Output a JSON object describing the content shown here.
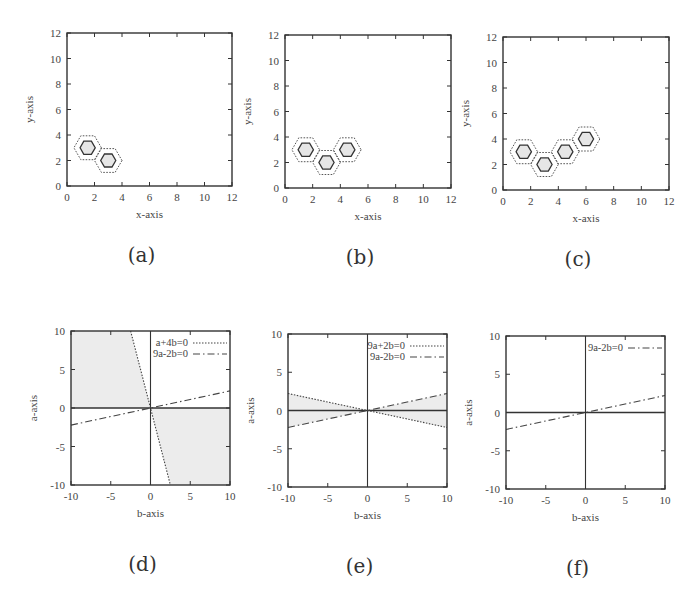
{
  "figure": {
    "captions": [
      "(a)",
      "(b)",
      "(c)",
      "(d)",
      "(e)",
      "(f)"
    ]
  },
  "colors": {
    "frame": "#333333",
    "hex_fill": "#e6e6e6",
    "shade": "#ececec",
    "line": "#444444"
  },
  "chart_data": [
    {
      "id": "a",
      "type": "diagram-scatter",
      "caption": "(a)",
      "xlabel": "x-axis",
      "ylabel": "y-axis",
      "xlim": [
        0,
        12
      ],
      "ylim": [
        0,
        12
      ],
      "xticks": [
        0,
        2,
        4,
        6,
        8,
        10,
        12
      ],
      "yticks": [
        0,
        2,
        4,
        6,
        8,
        10,
        12
      ],
      "grid": false,
      "frame": {
        "left": 67,
        "top": 33,
        "right": 232,
        "bottom": 186
      },
      "hexagons": [
        {
          "x": 1.5,
          "y": 3
        },
        {
          "x": 3,
          "y": 2
        }
      ],
      "hexagon_style": "solid inner hexagon (filled light gray) surrounded by dotted outer hexagon"
    },
    {
      "id": "b",
      "type": "diagram-scatter",
      "caption": "(b)",
      "xlabel": "x-axis",
      "ylabel": "y-axis",
      "xlim": [
        0,
        12
      ],
      "ylim": [
        0,
        12
      ],
      "xticks": [
        0,
        2,
        4,
        6,
        8,
        10,
        12
      ],
      "yticks": [
        0,
        2,
        4,
        6,
        8,
        10,
        12
      ],
      "grid": false,
      "frame": {
        "left": 285,
        "top": 35,
        "right": 451,
        "bottom": 188
      },
      "hexagons": [
        {
          "x": 1.5,
          "y": 3
        },
        {
          "x": 3,
          "y": 2
        },
        {
          "x": 4.5,
          "y": 3
        }
      ],
      "hexagon_style": "solid inner hexagon (filled light gray) surrounded by dotted outer hexagon"
    },
    {
      "id": "c",
      "type": "diagram-scatter",
      "caption": "(c)",
      "xlabel": "x-axis",
      "ylabel": "y-axis",
      "xlim": [
        0,
        12
      ],
      "ylim": [
        0,
        12
      ],
      "xticks": [
        0,
        2,
        4,
        6,
        8,
        10,
        12
      ],
      "yticks": [
        0,
        2,
        4,
        6,
        8,
        10,
        12
      ],
      "grid": false,
      "frame": {
        "left": 503,
        "top": 37,
        "right": 669,
        "bottom": 190
      },
      "hexagons": [
        {
          "x": 1.5,
          "y": 3
        },
        {
          "x": 3,
          "y": 2
        },
        {
          "x": 4.5,
          "y": 3
        },
        {
          "x": 6,
          "y": 4
        }
      ],
      "hexagon_style": "solid inner hexagon (filled light gray) surrounded by dotted outer hexagon"
    },
    {
      "id": "d",
      "type": "line",
      "caption": "(d)",
      "xlabel": "b-axis",
      "ylabel": "a-axis",
      "xlim": [
        -10,
        10
      ],
      "ylim": [
        -10,
        10
      ],
      "xticks": [
        -10,
        -5,
        0,
        5,
        10
      ],
      "yticks": [
        -10,
        -5,
        0,
        5,
        10
      ],
      "grid": false,
      "legend_position": "top-right",
      "frame": {
        "left": 71,
        "top": 331,
        "right": 230,
        "bottom": 485
      },
      "series": [
        {
          "name": "a+4b=0",
          "equation": "a = -4b",
          "style": "dotted",
          "points": [
            [
              -2.5,
              10
            ],
            [
              2.5,
              -10
            ]
          ]
        },
        {
          "name": "9a-2b=0",
          "equation": "a = 2b/9",
          "style": "dash-dot",
          "points": [
            [
              -10,
              -2.22
            ],
            [
              10,
              2.22
            ]
          ]
        }
      ],
      "axes_lines": [
        "a=0",
        "b=0"
      ],
      "shaded_regions": [
        {
          "description": "between a-axis top-left and line a+4b=0 above a=0",
          "polygon": [
            [
              -10,
              0
            ],
            [
              0,
              0
            ],
            [
              -2.5,
              10
            ],
            [
              -10,
              10
            ]
          ]
        },
        {
          "description": "bottom-right region below a=0 right of a+4b=0",
          "polygon": [
            [
              0,
              0
            ],
            [
              10,
              0
            ],
            [
              10,
              -10
            ],
            [
              2.5,
              -10
            ]
          ]
        }
      ]
    },
    {
      "id": "e",
      "type": "line",
      "caption": "(e)",
      "xlabel": "b-axis",
      "ylabel": "a-axis",
      "xlim": [
        -10,
        10
      ],
      "ylim": [
        -10,
        10
      ],
      "xticks": [
        -10,
        -5,
        0,
        5,
        10
      ],
      "yticks": [
        -10,
        -5,
        0,
        5,
        10
      ],
      "grid": false,
      "legend_position": "top-right",
      "frame": {
        "left": 288,
        "top": 334,
        "right": 447,
        "bottom": 487
      },
      "series": [
        {
          "name": "9a+2b=0",
          "equation": "a = -2b/9",
          "style": "dotted",
          "points": [
            [
              -10,
              2.22
            ],
            [
              10,
              -2.22
            ]
          ]
        },
        {
          "name": "9a-2b=0",
          "equation": "a = 2b/9",
          "style": "dash-dot",
          "points": [
            [
              -10,
              -2.22
            ],
            [
              10,
              2.22
            ]
          ]
        }
      ],
      "axes_lines": [
        "a=0",
        "b=0"
      ],
      "shaded_regions": [
        {
          "description": "left wedge between the two lines",
          "polygon": [
            [
              -10,
              2.22
            ],
            [
              0,
              0
            ],
            [
              -10,
              -2.22
            ]
          ]
        },
        {
          "description": "right wedge between the two lines",
          "polygon": [
            [
              10,
              2.22
            ],
            [
              0,
              0
            ],
            [
              10,
              -2.22
            ]
          ]
        }
      ]
    },
    {
      "id": "f",
      "type": "line",
      "caption": "(f)",
      "xlabel": "b-axis",
      "ylabel": "a-axis",
      "xlim": [
        -10,
        10
      ],
      "ylim": [
        -10,
        10
      ],
      "xticks": [
        -10,
        -5,
        0,
        5,
        10
      ],
      "yticks": [
        -10,
        -5,
        0,
        5,
        10
      ],
      "grid": false,
      "legend_position": "top-right",
      "frame": {
        "left": 506,
        "top": 336,
        "right": 665,
        "bottom": 489
      },
      "series": [
        {
          "name": "9a-2b=0",
          "equation": "a = 2b/9",
          "style": "dash-dot",
          "points": [
            [
              -10,
              -2.22
            ],
            [
              10,
              2.22
            ]
          ]
        }
      ],
      "axes_lines": [
        "a=0",
        "b=0"
      ],
      "shaded_regions": []
    }
  ]
}
